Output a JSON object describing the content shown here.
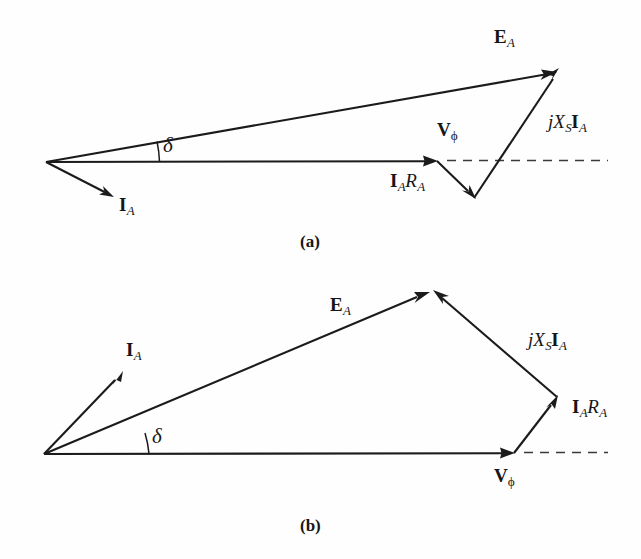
{
  "figure": {
    "background_color": "#fefefe",
    "line_color": "#1b1b1b",
    "dash_color": "#3a3a3a"
  },
  "panels": [
    {
      "id": "a",
      "caption": "(a)",
      "power_factor": "lagging",
      "labels": {
        "ea": {
          "bold": "E",
          "sub": "A"
        },
        "ia": {
          "bold": "I",
          "sub": "A"
        },
        "vphi": {
          "bold": "V",
          "sub": "ϕ"
        },
        "iara": {
          "bold_i": "I",
          "sub_i": "A",
          "italic_r": "R",
          "sub_r": "A"
        },
        "jxsia": {
          "italic_j": "j",
          "italic_x": "X",
          "sub_x": "S",
          "bold_i": "I",
          "sub_i": "A"
        },
        "delta": "δ"
      },
      "vectors": [
        {
          "name": "V_phi",
          "from": [
            46,
            162
          ],
          "to": [
            437,
            161
          ],
          "label": "Vϕ"
        },
        {
          "name": "I_A_R_A",
          "from": [
            437,
            161
          ],
          "to": [
            474,
            197
          ],
          "label": "I_A R_A"
        },
        {
          "name": "jX_S_I_A",
          "from": [
            474,
            197
          ],
          "to": [
            558,
            70
          ],
          "label": "jX_S I_A"
        },
        {
          "name": "E_A",
          "from": [
            46,
            162
          ],
          "to": [
            556,
            73
          ],
          "label": "E_A"
        },
        {
          "name": "I_A",
          "from": [
            46,
            162
          ],
          "to": [
            112,
            198
          ],
          "label": "I_A"
        }
      ],
      "reference_dash": {
        "from": [
          441,
          161
        ],
        "to": [
          608,
          161
        ]
      },
      "angle": {
        "vertex": [
          46,
          162
        ],
        "symbol": "δ",
        "radius": 113
      }
    },
    {
      "id": "b",
      "caption": "(b)",
      "power_factor": "leading",
      "labels": {
        "ea": {
          "bold": "E",
          "sub": "A"
        },
        "ia": {
          "bold": "I",
          "sub": "A"
        },
        "vphi": {
          "bold": "V",
          "sub": "ϕ"
        },
        "iara": {
          "bold_i": "I",
          "sub_i": "A",
          "italic_r": "R",
          "sub_r": "A"
        },
        "jxsia": {
          "italic_j": "j",
          "italic_x": "X",
          "sub_x": "S",
          "bold_i": "I",
          "sub_i": "A"
        },
        "delta": "δ"
      },
      "vectors": [
        {
          "name": "V_phi",
          "from": [
            44,
            454
          ],
          "to": [
            514,
            453
          ],
          "label": "Vϕ"
        },
        {
          "name": "I_A_R_A",
          "from": [
            514,
            453
          ],
          "to": [
            557,
            397
          ],
          "label": "I_A R_A"
        },
        {
          "name": "jX_S_I_A",
          "from": [
            557,
            397
          ],
          "to": [
            434,
            291
          ],
          "label": "jX_S I_A"
        },
        {
          "name": "E_A",
          "from": [
            44,
            454
          ],
          "to": [
            428,
            293
          ],
          "label": "E_A"
        },
        {
          "name": "I_A",
          "from": [
            44,
            454
          ],
          "to": [
            122,
            372
          ],
          "label": "I_A"
        }
      ],
      "reference_dash": {
        "from": [
          518,
          453
        ],
        "to": [
          608,
          453
        ]
      },
      "angle": {
        "vertex": [
          44,
          454
        ],
        "symbol": "δ",
        "radius": 105
      }
    }
  ]
}
